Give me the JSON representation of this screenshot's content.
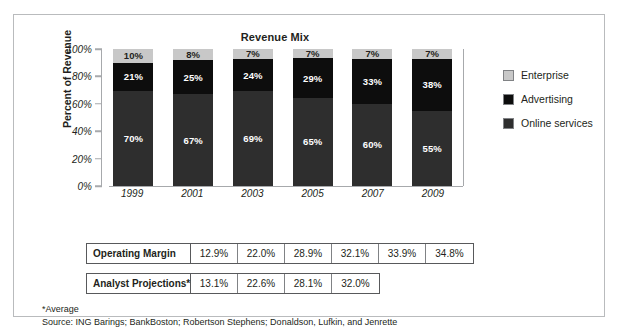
{
  "chart_data": {
    "type": "bar",
    "subtype": "stacked-column-100pct",
    "title": "Revenue Mix",
    "xlabel": "",
    "ylabel": "Percent of Revenue",
    "ylim": [
      0,
      100
    ],
    "yticks": [
      "0%",
      "20%",
      "40%",
      "60%",
      "80%",
      "100%"
    ],
    "ytick_values": [
      0,
      20,
      40,
      60,
      80,
      100
    ],
    "grid": false,
    "legend_position": "right",
    "categories": [
      "1999",
      "2001",
      "2003",
      "2005",
      "2007",
      "2009"
    ],
    "series": [
      {
        "name": "Online services",
        "color": "#2e2e2e",
        "values": [
          70,
          67,
          69,
          65,
          60,
          55
        ],
        "labels": [
          "70%",
          "67%",
          "69%",
          "65%",
          "60%",
          "55%"
        ]
      },
      {
        "name": "Advertising",
        "color": "#0d0d0d",
        "values": [
          21,
          25,
          24,
          29,
          33,
          38
        ],
        "labels": [
          "21%",
          "25%",
          "24%",
          "29%",
          "33%",
          "38%"
        ]
      },
      {
        "name": "Enterprise",
        "color": "#c8c8c8",
        "values": [
          10,
          8,
          7,
          7,
          7,
          7
        ],
        "labels": [
          "10%",
          "8%",
          "7%",
          "7%",
          "7%",
          "7%"
        ]
      }
    ],
    "stack_order_bottom_to_top": [
      "Online services",
      "Advertising",
      "Enterprise"
    ]
  },
  "legend": {
    "items": [
      {
        "label": "Enterprise",
        "color": "#c8c8c8"
      },
      {
        "label": "Advertising",
        "color": "#0d0d0d"
      },
      {
        "label": "Online services",
        "color": "#2e2e2e"
      }
    ]
  },
  "tables": [
    {
      "header": "Operating Margin",
      "values": [
        "12.9%",
        "22.0%",
        "28.9%",
        "32.1%",
        "33.9%",
        "34.8%"
      ]
    },
    {
      "header": "Analyst Projections*",
      "values": [
        "13.1%",
        "22.6%",
        "28.1%",
        "32.0%"
      ]
    }
  ],
  "footnotes": [
    "*Average",
    "Source: ING Barings; BankBoston; Robertson Stephens; Donaldson, Lufkin, and Jenrette"
  ]
}
